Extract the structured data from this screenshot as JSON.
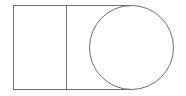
{
  "diagram": {
    "width": 186,
    "height": 96,
    "stroke_color": "#6e6e6e",
    "background": "#ffffff",
    "shapes": {
      "rectangle": {
        "x": 13,
        "y": 5,
        "width": 53,
        "height": 84
      },
      "connector_top": {
        "x1": 66,
        "y1": 5,
        "x2": 131,
        "y2": 5
      },
      "connector_bottom": {
        "x1": 66,
        "y1": 89,
        "x2": 131,
        "y2": 89
      },
      "circle": {
        "cx": 131.5,
        "cy": 47,
        "r": 41.5
      }
    }
  }
}
